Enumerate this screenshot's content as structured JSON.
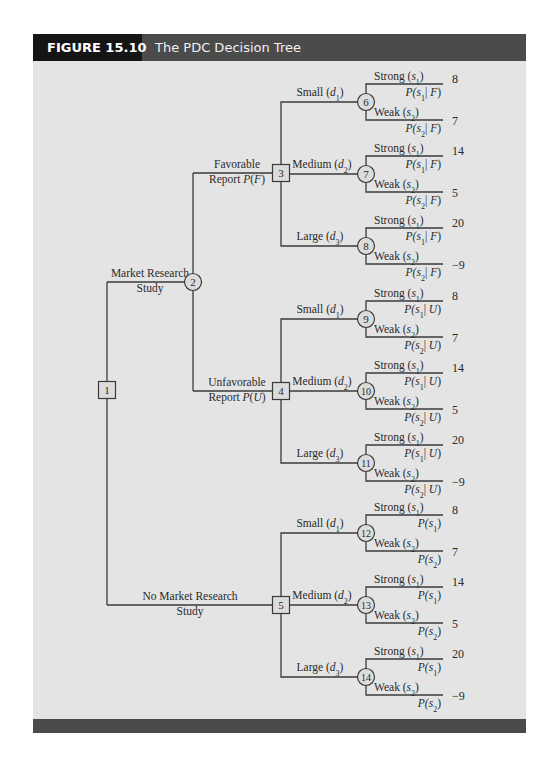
{
  "figure": {
    "label": "FIGURE 15.10",
    "title": "The PDC Decision Tree"
  },
  "colors": {
    "header_label_bg": "#151515",
    "header_bg": "#4b4b4b",
    "content_bg": "#e4e4e4",
    "line": "#3a3a3a"
  },
  "tree": {
    "root": {
      "id": "1",
      "type": "decision"
    },
    "study_branches": [
      {
        "label_line1": "Market Research",
        "label_line2": "Study",
        "to": "2"
      },
      {
        "label_line1": "No Market Research",
        "label_line2": "Study",
        "to": "5"
      }
    ],
    "report_node": {
      "id": "2",
      "type": "chance"
    },
    "report_branches": [
      {
        "label_line1": "Favorable",
        "label_line2_prefix": "Report ",
        "label_line2_prob": "P(F)",
        "to": "3"
      },
      {
        "label_line1": "Unfavorable",
        "label_line2_prefix": "Report ",
        "label_line2_prob": "P(U)",
        "to": "4"
      }
    ],
    "decision_nodes": [
      {
        "id": "3"
      },
      {
        "id": "4"
      },
      {
        "id": "5"
      }
    ],
    "decisions": [
      {
        "name": "Small",
        "sym": "d",
        "sub": "1"
      },
      {
        "name": "Medium",
        "sym": "d",
        "sub": "2"
      },
      {
        "name": "Large",
        "sym": "d",
        "sub": "3"
      }
    ],
    "states": [
      {
        "name": "Strong",
        "sym": "s",
        "sub": "1"
      },
      {
        "name": "Weak",
        "sym": "s",
        "sub": "2"
      }
    ],
    "chance_nodes": [
      {
        "id": "6",
        "parent": "3",
        "decision": "Small (d1)",
        "probs": [
          "P(s1 | F)",
          "P(s2 | F)"
        ],
        "payoffs": [
          "8",
          "7"
        ]
      },
      {
        "id": "7",
        "parent": "3",
        "decision": "Medium (d2)",
        "probs": [
          "P(s1 | F)",
          "P(s2 | F)"
        ],
        "payoffs": [
          "14",
          "5"
        ]
      },
      {
        "id": "8",
        "parent": "3",
        "decision": "Large (d3)",
        "probs": [
          "P(s1 | F)",
          "P(s2 | F)"
        ],
        "payoffs": [
          "20",
          "−9"
        ]
      },
      {
        "id": "9",
        "parent": "4",
        "decision": "Small (d1)",
        "probs": [
          "P(s1 | U)",
          "P(s2 | U)"
        ],
        "payoffs": [
          "8",
          "7"
        ]
      },
      {
        "id": "10",
        "parent": "4",
        "decision": "Medium (d2)",
        "probs": [
          "P(s1 | U)",
          "P(s2 | U)"
        ],
        "payoffs": [
          "14",
          "5"
        ]
      },
      {
        "id": "11",
        "parent": "4",
        "decision": "Large (d3)",
        "probs": [
          "P(s1 | U)",
          "P(s2 | U)"
        ],
        "payoffs": [
          "20",
          "−9"
        ]
      },
      {
        "id": "12",
        "parent": "5",
        "decision": "Small (d1)",
        "probs": [
          "P(s1)",
          "P(s2)"
        ],
        "payoffs": [
          "8",
          "7"
        ]
      },
      {
        "id": "13",
        "parent": "5",
        "decision": "Medium (d2)",
        "probs": [
          "P(s1)",
          "P(s2)"
        ],
        "payoffs": [
          "14",
          "5"
        ]
      },
      {
        "id": "14",
        "parent": "5",
        "decision": "Large (d3)",
        "probs": [
          "P(s1)",
          "P(s2)"
        ],
        "payoffs": [
          "20",
          "−9"
        ]
      }
    ]
  }
}
